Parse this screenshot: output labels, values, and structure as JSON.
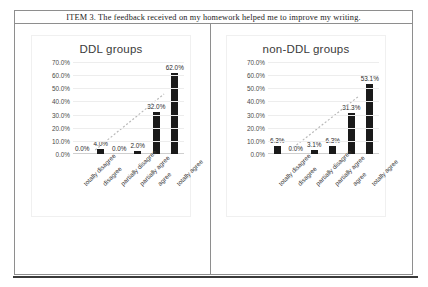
{
  "header": {
    "text": "ITEM 3. The feedback received on my homework helped me to improve my writing."
  },
  "charts": [
    {
      "title": "DDL groups",
      "yticks": [
        "70.0%",
        "60.0%",
        "50.0%",
        "40.0%",
        "30.0%",
        "20.0%",
        "10.0%",
        "0.0%"
      ],
      "categories": [
        "totally disagree",
        "disagree",
        "partially disagree",
        "partially agree",
        "agree",
        "totally agree"
      ],
      "labels": [
        "0.0%",
        "4.0%",
        "0.0%",
        "2.0%",
        "32.0%",
        "62.0%"
      ],
      "values": [
        0.0,
        4.0,
        0.0,
        2.0,
        32.0,
        62.0
      ]
    },
    {
      "title": "non-DDL groups",
      "yticks": [
        "70.0%",
        "60.0%",
        "50.0%",
        "40.0%",
        "30.0%",
        "20.0%",
        "10.0%",
        "0.0%"
      ],
      "categories": [
        "totally disagree",
        "disagree",
        "partially disagree",
        "partially agree",
        "agree",
        "totally agree"
      ],
      "labels": [
        "6.3%",
        "0.0%",
        "3.1%",
        "6.3%",
        "31.3%",
        "53.1%"
      ],
      "values": [
        6.3,
        0.0,
        3.1,
        6.3,
        31.3,
        53.1
      ]
    }
  ],
  "chart_data": [
    {
      "type": "bar",
      "title": "DDL groups",
      "categories": [
        "totally disagree",
        "disagree",
        "partially disagree",
        "partially agree",
        "agree",
        "totally agree"
      ],
      "values": [
        0.0,
        4.0,
        0.0,
        2.0,
        32.0,
        62.0
      ],
      "data_labels": [
        "0.0%",
        "4.0%",
        "0.0%",
        "2.0%",
        "32.0%",
        "62.0%"
      ],
      "xlabel": "",
      "ylabel": "",
      "ylim": [
        0,
        70
      ],
      "ytick_labels": [
        "0.0%",
        "10.0%",
        "20.0%",
        "30.0%",
        "40.0%",
        "50.0%",
        "60.0%",
        "70.0%"
      ],
      "grid": true,
      "legend": "none",
      "trendline": "dotted linear trend rising left to right",
      "bar_color": "#1a1a1a"
    },
    {
      "type": "bar",
      "title": "non-DDL groups",
      "categories": [
        "totally disagree",
        "disagree",
        "partially disagree",
        "partially agree",
        "agree",
        "totally agree"
      ],
      "values": [
        6.3,
        0.0,
        3.1,
        6.3,
        31.3,
        53.1
      ],
      "data_labels": [
        "6.3%",
        "0.0%",
        "3.1%",
        "6.3%",
        "31.3%",
        "53.1%"
      ],
      "xlabel": "",
      "ylabel": "",
      "ylim": [
        0,
        70
      ],
      "ytick_labels": [
        "0.0%",
        "10.0%",
        "20.0%",
        "30.0%",
        "40.0%",
        "50.0%",
        "60.0%",
        "70.0%"
      ],
      "grid": true,
      "legend": "none",
      "trendline": "dotted linear trend rising left to right",
      "bar_color": "#1a1a1a"
    }
  ]
}
